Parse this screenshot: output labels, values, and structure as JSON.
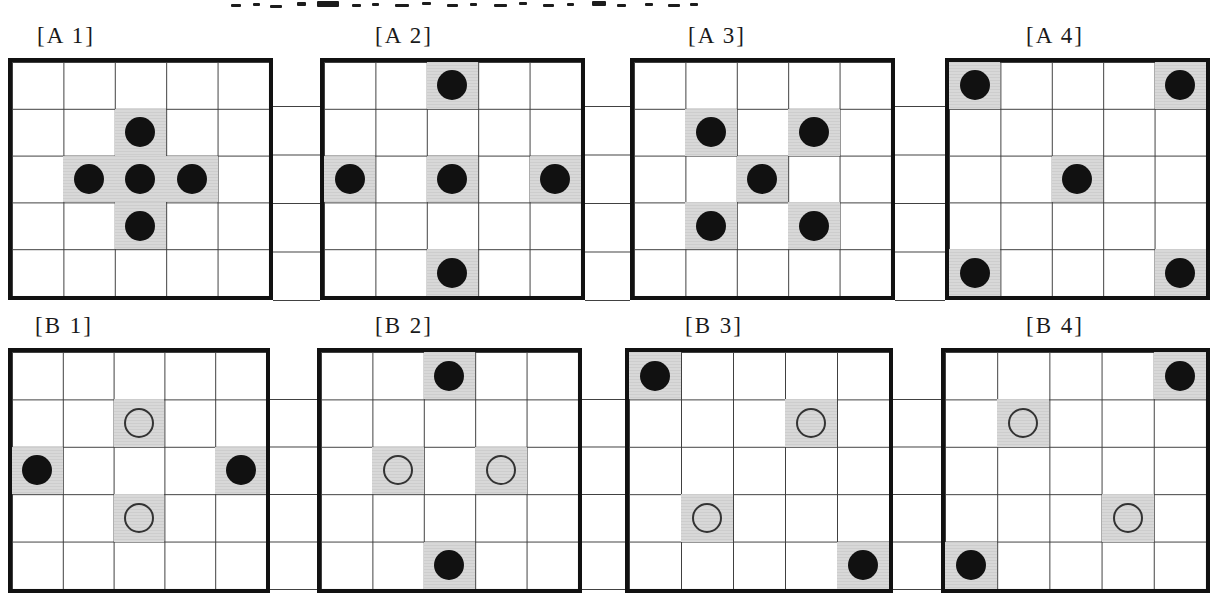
{
  "colors": {
    "shaded_cell": "#d8d8d8",
    "grid_line": "#404040",
    "thick_border": "#111111",
    "filled_dot": "#111111",
    "open_circle_ring": "#333333",
    "background": "#ffffff"
  },
  "figure": {
    "top_edge_text_fragments": [
      {
        "x": 231,
        "y": 4,
        "w": 10,
        "h": 3
      },
      {
        "x": 253,
        "y": 3,
        "w": 7,
        "h": 3
      },
      {
        "x": 270,
        "y": 5,
        "w": 12,
        "h": 3
      },
      {
        "x": 297,
        "y": 2,
        "w": 9,
        "h": 4
      },
      {
        "x": 317,
        "y": 1,
        "w": 22,
        "h": 6
      },
      {
        "x": 352,
        "y": 4,
        "w": 9,
        "h": 3
      },
      {
        "x": 372,
        "y": 3,
        "w": 7,
        "h": 3
      },
      {
        "x": 395,
        "y": 4,
        "w": 14,
        "h": 3
      },
      {
        "x": 422,
        "y": 2,
        "w": 9,
        "h": 3
      },
      {
        "x": 447,
        "y": 4,
        "w": 11,
        "h": 3
      },
      {
        "x": 470,
        "y": 3,
        "w": 7,
        "h": 3
      },
      {
        "x": 494,
        "y": 4,
        "w": 13,
        "h": 3
      },
      {
        "x": 519,
        "y": 2,
        "w": 8,
        "h": 3
      },
      {
        "x": 543,
        "y": 4,
        "w": 11,
        "h": 3
      },
      {
        "x": 567,
        "y": 3,
        "w": 7,
        "h": 3
      },
      {
        "x": 592,
        "y": 1,
        "w": 14,
        "h": 5
      },
      {
        "x": 617,
        "y": 4,
        "w": 9,
        "h": 3
      },
      {
        "x": 645,
        "y": 3,
        "w": 8,
        "h": 3
      },
      {
        "x": 668,
        "y": 4,
        "w": 12,
        "h": 3
      },
      {
        "x": 690,
        "y": 3,
        "w": 8,
        "h": 3
      }
    ],
    "panels": [
      {
        "id": "A1",
        "label": "[A 1]",
        "rows": 5,
        "cols": 5,
        "marks": [
          {
            "row": 1,
            "col": 2,
            "symbol": "filled"
          },
          {
            "row": 2,
            "col": 1,
            "symbol": "filled"
          },
          {
            "row": 2,
            "col": 2,
            "symbol": "filled"
          },
          {
            "row": 2,
            "col": 3,
            "symbol": "filled"
          },
          {
            "row": 3,
            "col": 2,
            "symbol": "filled"
          }
        ]
      },
      {
        "id": "A2",
        "label": "[A 2]",
        "rows": 5,
        "cols": 5,
        "marks": [
          {
            "row": 0,
            "col": 2,
            "symbol": "filled"
          },
          {
            "row": 2,
            "col": 0,
            "symbol": "filled"
          },
          {
            "row": 2,
            "col": 2,
            "symbol": "filled"
          },
          {
            "row": 2,
            "col": 4,
            "symbol": "filled"
          },
          {
            "row": 4,
            "col": 2,
            "symbol": "filled"
          }
        ]
      },
      {
        "id": "A3",
        "label": "[A 3]",
        "rows": 5,
        "cols": 5,
        "marks": [
          {
            "row": 1,
            "col": 1,
            "symbol": "filled"
          },
          {
            "row": 1,
            "col": 3,
            "symbol": "filled"
          },
          {
            "row": 2,
            "col": 2,
            "symbol": "filled"
          },
          {
            "row": 3,
            "col": 1,
            "symbol": "filled"
          },
          {
            "row": 3,
            "col": 3,
            "symbol": "filled"
          }
        ]
      },
      {
        "id": "A4",
        "label": "[A 4]",
        "rows": 5,
        "cols": 5,
        "marks": [
          {
            "row": 0,
            "col": 0,
            "symbol": "filled"
          },
          {
            "row": 0,
            "col": 4,
            "symbol": "filled"
          },
          {
            "row": 2,
            "col": 2,
            "symbol": "filled"
          },
          {
            "row": 4,
            "col": 0,
            "symbol": "filled"
          },
          {
            "row": 4,
            "col": 4,
            "symbol": "filled"
          }
        ]
      },
      {
        "id": "B1",
        "label": "[B 1]",
        "rows": 5,
        "cols": 5,
        "marks": [
          {
            "row": 1,
            "col": 2,
            "symbol": "open"
          },
          {
            "row": 2,
            "col": 0,
            "symbol": "filled"
          },
          {
            "row": 2,
            "col": 4,
            "symbol": "filled"
          },
          {
            "row": 3,
            "col": 2,
            "symbol": "open"
          }
        ]
      },
      {
        "id": "B2",
        "label": "[B 2]",
        "rows": 5,
        "cols": 5,
        "marks": [
          {
            "row": 0,
            "col": 2,
            "symbol": "filled"
          },
          {
            "row": 2,
            "col": 1,
            "symbol": "open"
          },
          {
            "row": 2,
            "col": 3,
            "symbol": "open"
          },
          {
            "row": 4,
            "col": 2,
            "symbol": "filled"
          }
        ]
      },
      {
        "id": "B3",
        "label": "[B 3]",
        "rows": 5,
        "cols": 5,
        "marks": [
          {
            "row": 0,
            "col": 0,
            "symbol": "filled"
          },
          {
            "row": 1,
            "col": 3,
            "symbol": "open"
          },
          {
            "row": 3,
            "col": 1,
            "symbol": "open"
          },
          {
            "row": 4,
            "col": 4,
            "symbol": "filled"
          }
        ]
      },
      {
        "id": "B4",
        "label": "[B 4]",
        "rows": 5,
        "cols": 5,
        "marks": [
          {
            "row": 0,
            "col": 4,
            "symbol": "filled"
          },
          {
            "row": 1,
            "col": 1,
            "symbol": "open"
          },
          {
            "row": 3,
            "col": 3,
            "symbol": "open"
          },
          {
            "row": 4,
            "col": 0,
            "symbol": "filled"
          }
        ]
      }
    ]
  }
}
